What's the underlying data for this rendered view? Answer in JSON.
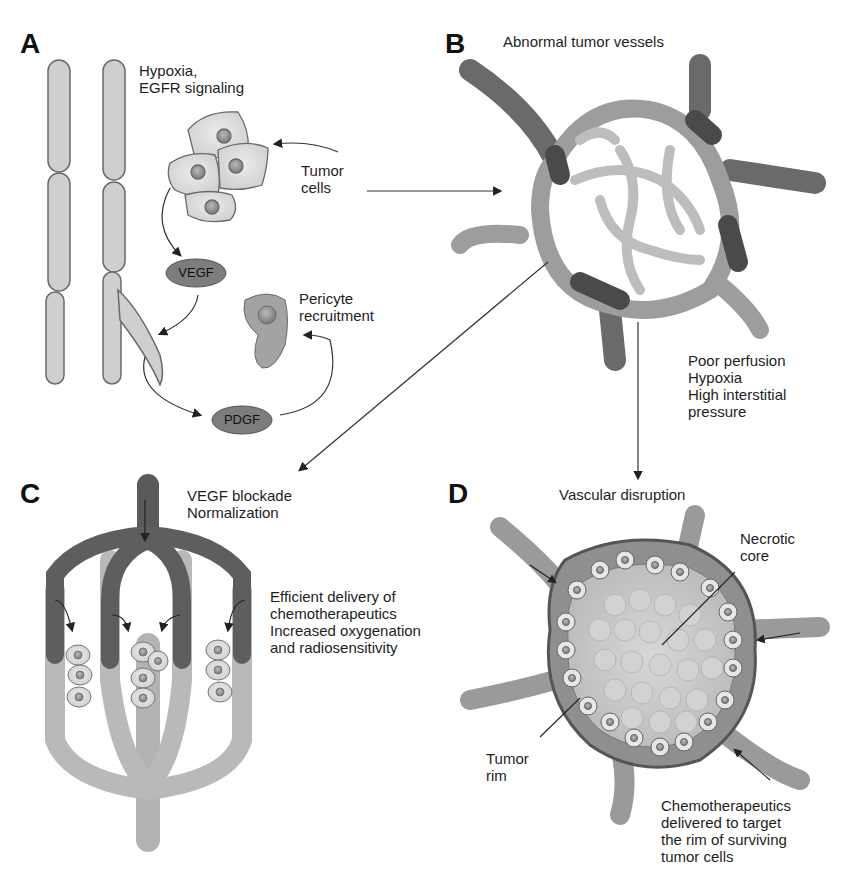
{
  "colors": {
    "vessel_light": "#c9c9c9",
    "vessel_mid": "#9d9d9d",
    "vessel_dark": "#555555",
    "outline": "#6a6a6a",
    "pill_fill": "#7d7d7d",
    "background": "#ffffff"
  },
  "panels": {
    "A": {
      "letter": "A",
      "hypoxia_label": "Hypoxia,\nEGFR signaling",
      "tumor_cells_label": "Tumor\ncells",
      "vegf_pill": "VEGF",
      "pdgf_pill": "PDGF",
      "pericyte_label": "Pericyte\nrecruitment"
    },
    "B": {
      "letter": "B",
      "title": "Abnormal tumor vessels",
      "consequences": "Poor perfusion\nHypoxia\nHigh interstitial\npressure"
    },
    "C": {
      "letter": "C",
      "title": "VEGF blockade\nNormalization",
      "outcome": "Efficient delivery of\nchemotherapeutics\nIncreased oxygenation\nand radiosensitivity"
    },
    "D": {
      "letter": "D",
      "title": "Vascular disruption",
      "necrotic_label": "Necrotic\ncore",
      "rim_label": "Tumor\nrim",
      "outcome": "Chemotherapeutics\ndelivered to target\nthe rim of surviving\ntumor cells"
    }
  }
}
